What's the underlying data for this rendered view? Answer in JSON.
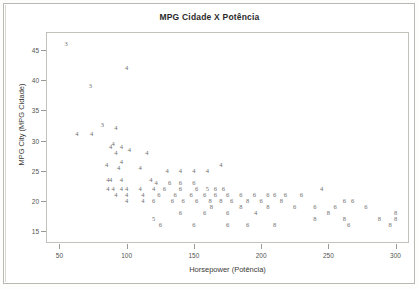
{
  "figure": {
    "title": "MPG Cidade X Potência",
    "background_color": "#ffffff",
    "frame_color": "#c2c2bd",
    "marker_color": "#6e6e6e"
  },
  "chart_data": {
    "type": "scatter",
    "title": "MPG Cidade X Potência",
    "xlabel": "Horsepower (Potência)",
    "ylabel": "MPG City (MPG Cidade)",
    "xlim": [
      40,
      310
    ],
    "ylim": [
      13,
      48
    ],
    "xticks": [
      50,
      100,
      150,
      200,
      250,
      300
    ],
    "yticks": [
      15,
      20,
      25,
      30,
      35,
      40,
      45
    ],
    "grid": false,
    "legend": "none",
    "marker_style": "group-digit-label",
    "marker_meaning": "Number of cylinders drawn as the plotted digit",
    "groups": [
      "3",
      "4",
      "5",
      "6",
      "8"
    ],
    "points": [
      {
        "x": 55,
        "y": 46,
        "label": "3"
      },
      {
        "x": 100,
        "y": 42,
        "label": "4"
      },
      {
        "x": 73,
        "y": 39,
        "label": "3"
      },
      {
        "x": 82,
        "y": 32.5,
        "label": "3"
      },
      {
        "x": 92,
        "y": 32,
        "label": "4"
      },
      {
        "x": 63,
        "y": 31,
        "label": "4"
      },
      {
        "x": 74,
        "y": 31,
        "label": "4"
      },
      {
        "x": 90,
        "y": 29.5,
        "label": "4"
      },
      {
        "x": 88,
        "y": 29,
        "label": "4"
      },
      {
        "x": 96,
        "y": 29,
        "label": "4"
      },
      {
        "x": 92,
        "y": 28,
        "label": "4"
      },
      {
        "x": 102,
        "y": 28.5,
        "label": "4"
      },
      {
        "x": 115,
        "y": 28,
        "label": "4"
      },
      {
        "x": 85,
        "y": 26,
        "label": "4"
      },
      {
        "x": 96,
        "y": 26.5,
        "label": "4"
      },
      {
        "x": 94,
        "y": 25.5,
        "label": "4"
      },
      {
        "x": 110,
        "y": 25.5,
        "label": "4"
      },
      {
        "x": 130,
        "y": 25,
        "label": "4"
      },
      {
        "x": 140,
        "y": 25,
        "label": "4"
      },
      {
        "x": 150,
        "y": 25,
        "label": "4"
      },
      {
        "x": 160,
        "y": 25,
        "label": "4"
      },
      {
        "x": 170,
        "y": 26,
        "label": "4"
      },
      {
        "x": 86,
        "y": 23.5,
        "label": "4"
      },
      {
        "x": 88,
        "y": 23.5,
        "label": "4"
      },
      {
        "x": 96,
        "y": 23.5,
        "label": "4"
      },
      {
        "x": 118,
        "y": 23.5,
        "label": "4"
      },
      {
        "x": 122,
        "y": 23,
        "label": "4"
      },
      {
        "x": 132,
        "y": 23,
        "label": "6"
      },
      {
        "x": 140,
        "y": 23,
        "label": "6"
      },
      {
        "x": 150,
        "y": 23,
        "label": "6"
      },
      {
        "x": 86,
        "y": 22,
        "label": "4"
      },
      {
        "x": 90,
        "y": 22,
        "label": "4"
      },
      {
        "x": 96,
        "y": 22,
        "label": "4"
      },
      {
        "x": 100,
        "y": 22,
        "label": "4"
      },
      {
        "x": 110,
        "y": 22,
        "label": "4"
      },
      {
        "x": 120,
        "y": 22,
        "label": "4"
      },
      {
        "x": 128,
        "y": 22,
        "label": "6"
      },
      {
        "x": 140,
        "y": 22,
        "label": "6"
      },
      {
        "x": 152,
        "y": 22,
        "label": "6"
      },
      {
        "x": 160,
        "y": 22,
        "label": "5"
      },
      {
        "x": 166,
        "y": 22,
        "label": "6"
      },
      {
        "x": 172,
        "y": 22,
        "label": "6"
      },
      {
        "x": 92,
        "y": 21,
        "label": "4"
      },
      {
        "x": 100,
        "y": 21,
        "label": "4"
      },
      {
        "x": 112,
        "y": 21,
        "label": "4"
      },
      {
        "x": 124,
        "y": 21,
        "label": "6"
      },
      {
        "x": 136,
        "y": 21,
        "label": "6"
      },
      {
        "x": 148,
        "y": 21,
        "label": "6"
      },
      {
        "x": 158,
        "y": 21,
        "label": "6"
      },
      {
        "x": 166,
        "y": 21,
        "label": "6"
      },
      {
        "x": 175,
        "y": 21,
        "label": "6"
      },
      {
        "x": 185,
        "y": 21,
        "label": "6"
      },
      {
        "x": 195,
        "y": 21,
        "label": "6"
      },
      {
        "x": 205,
        "y": 21,
        "label": "6"
      },
      {
        "x": 210,
        "y": 21,
        "label": "6"
      },
      {
        "x": 218,
        "y": 21,
        "label": "6"
      },
      {
        "x": 230,
        "y": 21,
        "label": "6"
      },
      {
        "x": 100,
        "y": 20,
        "label": "4"
      },
      {
        "x": 112,
        "y": 20,
        "label": "4"
      },
      {
        "x": 120,
        "y": 20,
        "label": "6"
      },
      {
        "x": 134,
        "y": 20,
        "label": "6"
      },
      {
        "x": 142,
        "y": 20,
        "label": "6"
      },
      {
        "x": 152,
        "y": 20,
        "label": "6"
      },
      {
        "x": 162,
        "y": 20,
        "label": "8"
      },
      {
        "x": 170,
        "y": 20,
        "label": "8"
      },
      {
        "x": 178,
        "y": 20,
        "label": "6"
      },
      {
        "x": 190,
        "y": 20,
        "label": "8"
      },
      {
        "x": 200,
        "y": 20,
        "label": "6"
      },
      {
        "x": 215,
        "y": 20,
        "label": "8"
      },
      {
        "x": 163,
        "y": 19,
        "label": "8"
      },
      {
        "x": 185,
        "y": 19,
        "label": "8"
      },
      {
        "x": 205,
        "y": 19,
        "label": "8"
      },
      {
        "x": 120,
        "y": 17,
        "label": "5"
      },
      {
        "x": 140,
        "y": 18,
        "label": "6"
      },
      {
        "x": 158,
        "y": 18,
        "label": "6"
      },
      {
        "x": 175,
        "y": 18,
        "label": "6"
      },
      {
        "x": 196,
        "y": 18,
        "label": "4"
      },
      {
        "x": 225,
        "y": 19,
        "label": "6"
      },
      {
        "x": 240,
        "y": 19,
        "label": "6"
      },
      {
        "x": 245,
        "y": 22,
        "label": "4"
      },
      {
        "x": 255,
        "y": 19,
        "label": "6"
      },
      {
        "x": 262,
        "y": 20,
        "label": "6"
      },
      {
        "x": 268,
        "y": 20,
        "label": "6"
      },
      {
        "x": 278,
        "y": 19,
        "label": "6"
      },
      {
        "x": 250,
        "y": 18,
        "label": "8"
      },
      {
        "x": 240,
        "y": 17,
        "label": "8"
      },
      {
        "x": 262,
        "y": 17,
        "label": "8"
      },
      {
        "x": 288,
        "y": 17,
        "label": "8"
      },
      {
        "x": 300,
        "y": 18,
        "label": "8"
      },
      {
        "x": 300,
        "y": 17,
        "label": "8"
      },
      {
        "x": 296,
        "y": 16,
        "label": "8"
      },
      {
        "x": 265,
        "y": 16,
        "label": "6"
      },
      {
        "x": 175,
        "y": 16,
        "label": "6"
      },
      {
        "x": 150,
        "y": 16,
        "label": "6"
      },
      {
        "x": 125,
        "y": 16,
        "label": "6"
      },
      {
        "x": 210,
        "y": 16,
        "label": "8"
      },
      {
        "x": 190,
        "y": 16,
        "label": "6"
      }
    ]
  }
}
